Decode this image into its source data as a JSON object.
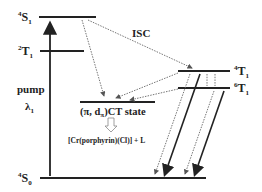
{
  "diagram": {
    "type": "energy-level-diagram",
    "levels": [
      {
        "id": "4S1",
        "sup": "4",
        "base": "S",
        "sub": "1"
      },
      {
        "id": "2T1",
        "sup": "2",
        "base": "T",
        "sub": "1"
      },
      {
        "id": "4T1",
        "sup": "4",
        "base": "T",
        "sub": "1"
      },
      {
        "id": "6T1",
        "sup": "6",
        "base": "T",
        "sub": "1"
      },
      {
        "id": "4S0",
        "sup": "4",
        "base": "S",
        "sub": "0"
      }
    ],
    "ct_state": {
      "prefix": "(π, d",
      "sub": "π",
      "suffix": ")CT state"
    },
    "pump_label": "pump",
    "pump_wavelength": {
      "base": "λ",
      "sub": "1"
    },
    "isc_label": "ISC",
    "product_label": "[Cr(porphyrin)(Cl)] + L"
  }
}
